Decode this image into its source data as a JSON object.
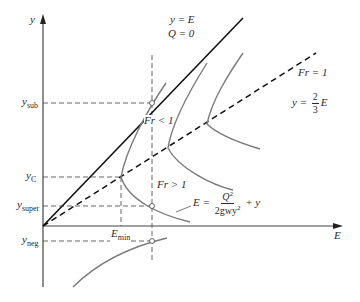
{
  "diagram": {
    "axes": {
      "y_label": "y",
      "x_label": "E"
    },
    "lines": {
      "ye_line_label_1": "y = E",
      "ye_line_label_2": "Q = 0",
      "fr1_line_label": "Fr = 1",
      "fr1_eq_prefix": "y = ",
      "fr1_eq_num": "2",
      "fr1_eq_den": "3",
      "fr1_eq_suffix": "E"
    },
    "regions": {
      "subcritical": "Fr < 1",
      "supercritical": "Fr > 1"
    },
    "energy_equation": {
      "lhs": "E = ",
      "num": "Q",
      "num_sup": "2",
      "den": "2gwy",
      "den_sup": "2",
      "rhs": " + y"
    },
    "y_ticks": [
      {
        "base": "y",
        "sub": "sub"
      },
      {
        "base": "y",
        "sub": "C"
      },
      {
        "base": "y",
        "sub": "super"
      },
      {
        "base": "y",
        "sub": "neg"
      }
    ],
    "x_ticks": [
      {
        "base": "E",
        "sub": "min"
      }
    ],
    "colors": {
      "axis": "#333333",
      "curve": "#7a7a7a",
      "guide": "#666666",
      "line": "#111111"
    }
  }
}
